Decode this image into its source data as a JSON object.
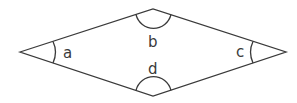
{
  "diagram": {
    "shape": "rhombus",
    "colors": {
      "stroke": "#3a3a3a",
      "background": "#ffffff"
    },
    "vertices": {
      "left": [
        20,
        52
      ],
      "top": [
        153,
        9
      ],
      "right": [
        286,
        52
      ],
      "bottom": [
        153,
        96
      ]
    },
    "angles": [
      {
        "id": "a",
        "label": "a",
        "vertex": "left"
      },
      {
        "id": "b",
        "label": "b",
        "vertex": "top"
      },
      {
        "id": "c",
        "label": "c",
        "vertex": "right"
      },
      {
        "id": "d",
        "label": "d",
        "vertex": "bottom"
      }
    ]
  }
}
